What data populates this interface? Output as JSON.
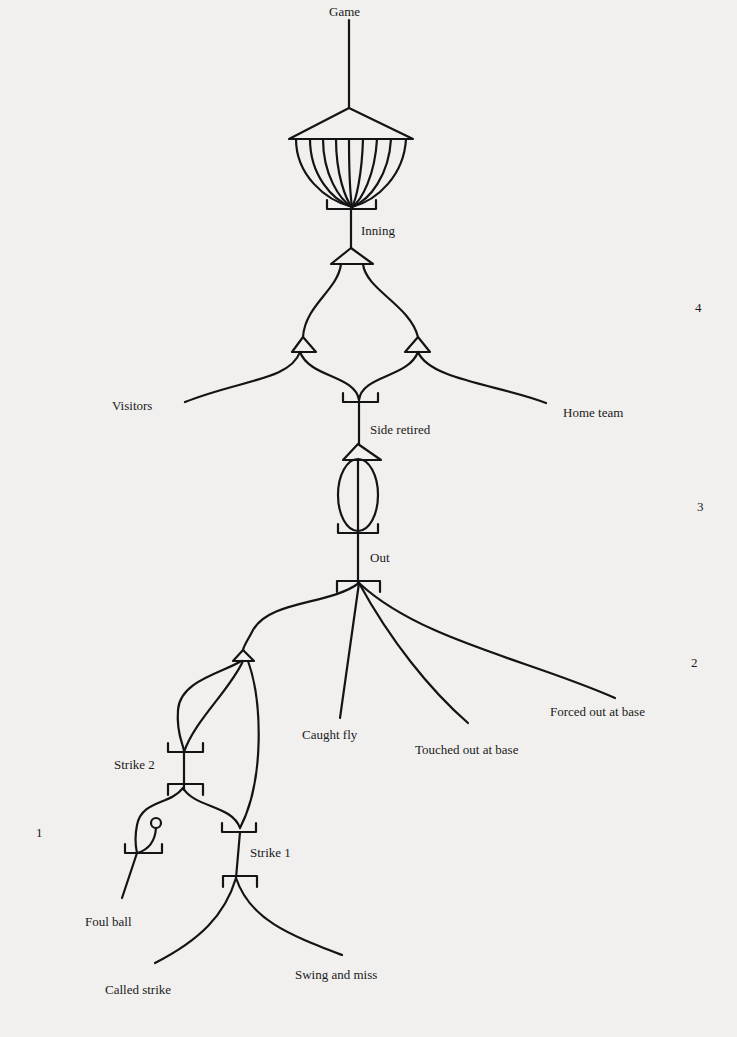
{
  "diagram": {
    "type": "plan-tree",
    "nodes": {
      "game": "Game",
      "inning": "Inning",
      "visitors": "Visitors",
      "home_team": "Home team",
      "side_retired": "Side retired",
      "out": "Out",
      "caught_fly": "Caught fly",
      "touched_out": "Touched out at base",
      "forced_out": "Forced out at base",
      "strike_2": "Strike 2",
      "strike_1": "Strike 1",
      "foul_ball": "Foul ball",
      "called_strike": "Called strike",
      "swing_and_miss": "Swing and miss"
    },
    "level_markers": [
      "4",
      "3",
      "2",
      "1"
    ],
    "edges": [
      [
        "Game",
        "Inning",
        "iteration x9"
      ],
      [
        "Inning",
        "Visitors"
      ],
      [
        "Inning",
        "Home team"
      ],
      [
        "Visitors",
        "Side retired"
      ],
      [
        "Home team",
        "Side retired"
      ],
      [
        "Side retired",
        "Out",
        "iteration x3"
      ],
      [
        "Out",
        "Strike 2"
      ],
      [
        "Out",
        "Caught fly"
      ],
      [
        "Out",
        "Touched out at base"
      ],
      [
        "Out",
        "Forced out at base"
      ],
      [
        "Strike 2",
        "Foul ball"
      ],
      [
        "Strike 2",
        "Strike 1"
      ],
      [
        "Strike 1",
        "Called strike"
      ],
      [
        "Strike 1",
        "Swing and miss"
      ]
    ]
  }
}
